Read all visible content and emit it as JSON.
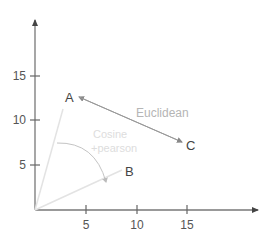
{
  "diagram": {
    "axes": {
      "y_ticks": [
        {
          "label": "5",
          "value": 5
        },
        {
          "label": "10",
          "value": 10
        },
        {
          "label": "15",
          "value": 15
        }
      ],
      "x_ticks": [
        {
          "label": "5",
          "value": 5
        },
        {
          "label": "10",
          "value": 10
        },
        {
          "label": "15",
          "value": 15
        }
      ]
    },
    "points": {
      "A": {
        "label": "A",
        "x": 3,
        "y": 11
      },
      "B": {
        "label": "B",
        "x": 9,
        "y": 4.5
      },
      "C": {
        "label": "C",
        "x": 15,
        "y": 7.5
      }
    },
    "labels": {
      "euclidean": "Euclidean",
      "cosine": "Cosine",
      "pearson": "+pearson"
    },
    "colors": {
      "axis": "#777777",
      "vector": "#e3e3e3",
      "euclidean_line": "#999999",
      "arc": "#bbbbbb"
    }
  }
}
